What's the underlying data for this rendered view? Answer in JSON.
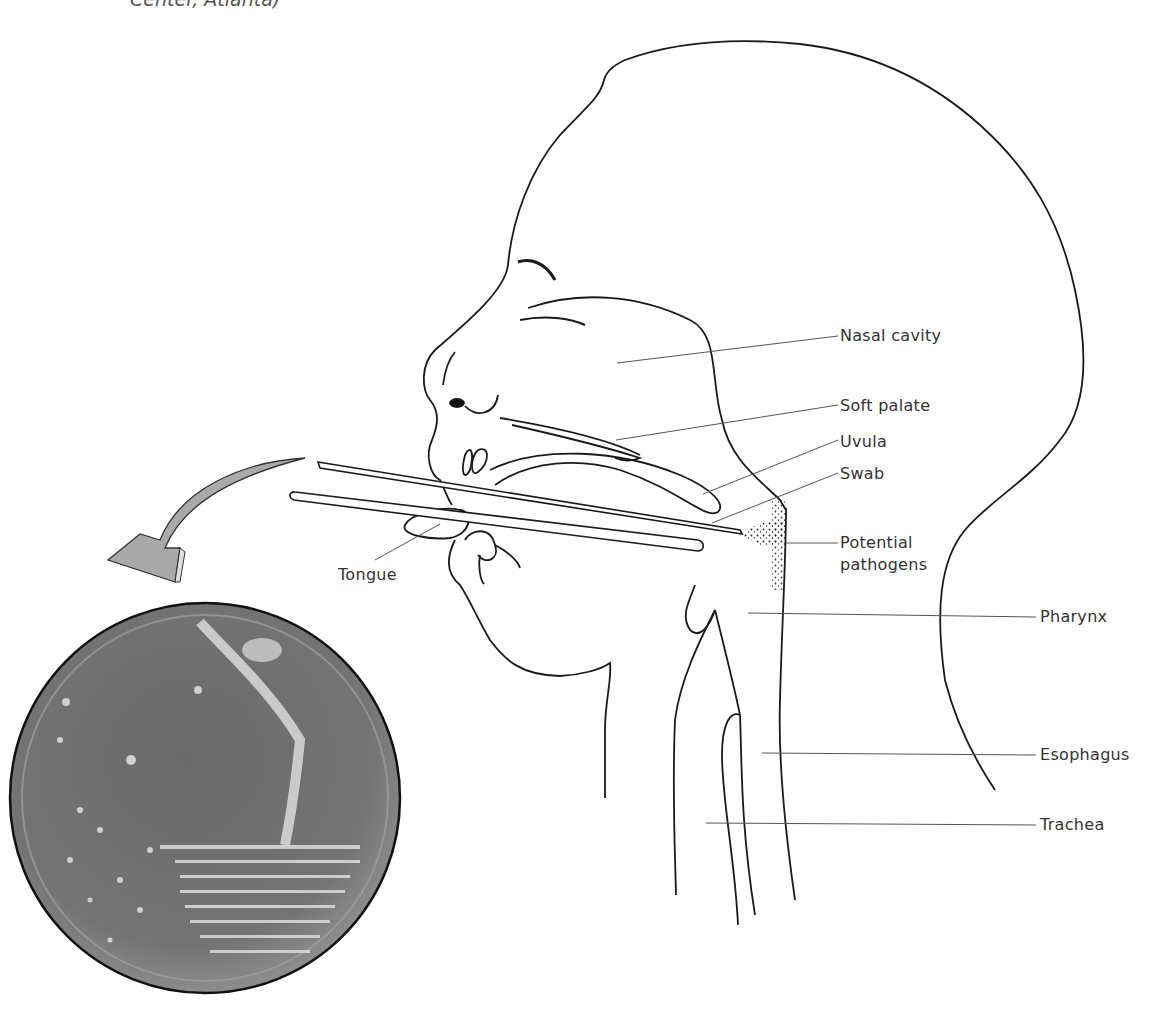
{
  "figure": {
    "caption_fragment": "Center, Atlanta)",
    "labels": {
      "nasal_cavity": "Nasal cavity",
      "soft_palate": "Soft palate",
      "uvula": "Uvula",
      "swab": "Swab",
      "potential_pathogens_line1": "Potential",
      "potential_pathogens_line2": "pathogens",
      "pharynx": "Pharynx",
      "esophagus": "Esophagus",
      "trachea": "Trachea",
      "tongue": "Tongue"
    },
    "elements": {
      "arrow": "curved-arrow-to-culture-plate",
      "plate": "petri-dish-streak-culture-photo"
    },
    "colors": {
      "line": "#1a1a1a",
      "leader": "#555555",
      "arrow_fill": "#a9a9a9",
      "plate_fill": "#6f6f6f"
    }
  }
}
